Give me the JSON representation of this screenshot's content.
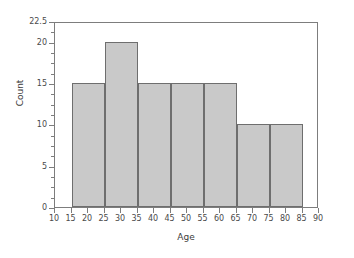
{
  "chart_data": {
    "type": "bar",
    "title": "",
    "subtitle": "",
    "xlabel": "Age",
    "ylabel": "Count",
    "xlim": [
      10,
      90
    ],
    "ylim": [
      0,
      22.5
    ],
    "grid": false,
    "legend": null,
    "bin_width": 10,
    "bin_edges": [
      15,
      25,
      35,
      45,
      55,
      65,
      75,
      85
    ],
    "categories": [
      "15-25",
      "25-35",
      "35-45",
      "45-55",
      "55-65",
      "65-75",
      "75-85"
    ],
    "values": [
      15,
      20,
      15,
      15,
      15,
      10,
      10
    ],
    "bars": [
      {
        "x0": 15,
        "x1": 25,
        "count": 15
      },
      {
        "x0": 25,
        "x1": 35,
        "count": 20
      },
      {
        "x0": 35,
        "x1": 45,
        "count": 15
      },
      {
        "x0": 45,
        "x1": 55,
        "count": 15
      },
      {
        "x0": 55,
        "x1": 65,
        "count": 15
      },
      {
        "x0": 65,
        "x1": 75,
        "count": 10
      },
      {
        "x0": 75,
        "x1": 85,
        "count": 10
      }
    ],
    "x_ticks": [
      10,
      15,
      20,
      25,
      30,
      35,
      40,
      45,
      50,
      55,
      60,
      65,
      70,
      75,
      80,
      85,
      90
    ],
    "x_tick_labels": [
      "10",
      "15",
      "20",
      "25",
      "30",
      "35",
      "40",
      "45",
      "50",
      "55",
      "60",
      "65",
      "70",
      "75",
      "80",
      "85",
      "90"
    ],
    "y_ticks_major": [
      0,
      5,
      10,
      15,
      20,
      22.5
    ],
    "y_tick_labels": [
      "0",
      "5",
      "10",
      "15",
      "20",
      "22.5"
    ],
    "y_ticks_minor": [
      1.25,
      2.5,
      3.75,
      6.25,
      7.5,
      8.75,
      11.25,
      12.5,
      13.75,
      16.25,
      17.5,
      18.75,
      21.25
    ],
    "colors": {
      "bar_fill": "#c9c9c9",
      "bar_edge": "#6e6e6e",
      "axis": "#7d7d7d",
      "text": "#4a4a4a",
      "label_text": "#3c3c3c",
      "background": "#ffffff"
    }
  }
}
